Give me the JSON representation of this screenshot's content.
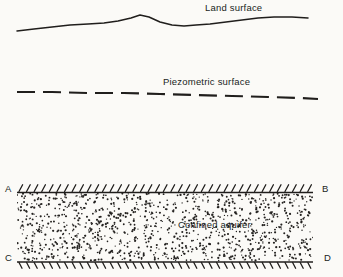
{
  "figure": {
    "type": "hydrogeology-cross-section",
    "background_color": "#fbfaf7",
    "ink_color": "#201e1c",
    "width": 343,
    "height": 277
  },
  "labels": {
    "land_surface": "Land surface",
    "piezometric_surface": "Piezometric surface",
    "confined_aquifer": "Confined aquifer"
  },
  "corners": {
    "top_left": "A",
    "top_right": "B",
    "bottom_left": "C",
    "bottom_right": "D"
  },
  "chart_data": {
    "type": "line",
    "xlabel": "",
    "ylabel": "",
    "grid": false,
    "legend": "none",
    "series": [
      {
        "name": "Land surface",
        "style": "solid",
        "points": [
          [
            17,
            31
          ],
          [
            34,
            29
          ],
          [
            52,
            27
          ],
          [
            70,
            25
          ],
          [
            88,
            24
          ],
          [
            104,
            23
          ],
          [
            118,
            21
          ],
          [
            131,
            18
          ],
          [
            140,
            15
          ],
          [
            149,
            17
          ],
          [
            160,
            22
          ],
          [
            172,
            25
          ],
          [
            184,
            26
          ],
          [
            196,
            25
          ],
          [
            210,
            24
          ],
          [
            226,
            22
          ],
          [
            242,
            20
          ],
          [
            258,
            18
          ],
          [
            274,
            17
          ],
          [
            292,
            17
          ],
          [
            308,
            18
          ]
        ]
      },
      {
        "name": "Piezometric surface",
        "style": "dashed",
        "dash_length": 18,
        "gap_length": 8,
        "points": [
          [
            17,
            92
          ],
          [
            52,
            92
          ],
          [
            88,
            93
          ],
          [
            124,
            93
          ],
          [
            160,
            94
          ],
          [
            196,
            95
          ],
          [
            232,
            96
          ],
          [
            268,
            97
          ],
          [
            300,
            98
          ],
          [
            318,
            99
          ]
        ]
      }
    ],
    "aquifer_block": {
      "label": "Confined aquifer",
      "x_left": 17,
      "x_right": 313,
      "y_top": 192,
      "y_bottom": 262,
      "fill": "stipple",
      "top_boundary": "hatched-confining-bed",
      "bottom_boundary": "hatched-confining-bed"
    }
  }
}
